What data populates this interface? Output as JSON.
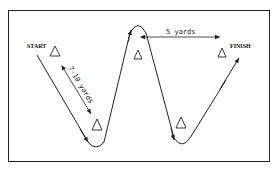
{
  "diagram": {
    "start_label": "START",
    "finish_label": "FINISH",
    "diagonal_distance": "7-10 yards",
    "horizontal_distance": "5 yards",
    "cones": [
      {
        "id": "cone-start",
        "x": 55,
        "y": 52
      },
      {
        "id": "cone-bottom-1",
        "x": 97,
        "y": 125
      },
      {
        "id": "cone-top-middle",
        "x": 138,
        "y": 53
      },
      {
        "id": "cone-bottom-2",
        "x": 181,
        "y": 127
      },
      {
        "id": "cone-finish",
        "x": 219,
        "y": 52
      }
    ],
    "colors": {
      "line": "#222222",
      "background": "#ffffff"
    }
  }
}
